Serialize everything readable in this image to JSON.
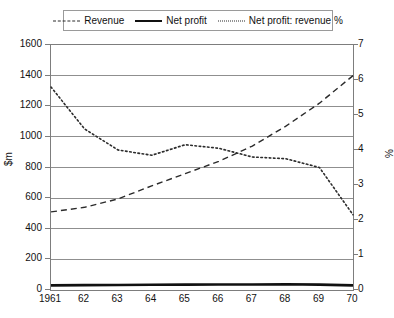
{
  "chart_data": {
    "type": "line",
    "title": "",
    "xlabel": "",
    "ylabel": "$m",
    "ylabel_secondary": "%",
    "categories": [
      "1961",
      "62",
      "63",
      "64",
      "65",
      "66",
      "67",
      "68",
      "69",
      "70"
    ],
    "ylim": [
      0,
      1600
    ],
    "yticks": [
      0,
      200,
      400,
      600,
      800,
      1000,
      1200,
      1400,
      1600
    ],
    "ylim_secondary": [
      0,
      7
    ],
    "yticks_secondary": [
      0,
      1,
      2,
      3,
      4,
      5,
      6,
      7
    ],
    "grid": true,
    "legend_position": "top",
    "series": [
      {
        "name": "Revenue",
        "axis": "left",
        "style": "dashed",
        "values": [
          510,
          540,
          595,
          680,
          760,
          840,
          940,
          1070,
          1220,
          1400
        ]
      },
      {
        "name": "Net profit",
        "axis": "left",
        "style": "solid",
        "values": [
          30,
          32,
          33,
          34,
          35,
          36,
          36,
          38,
          35,
          30
        ]
      },
      {
        "name": "Net profit: revenue %",
        "axis": "right",
        "style": "dotted",
        "values": [
          5.8,
          4.6,
          4.0,
          3.85,
          4.15,
          4.05,
          3.8,
          3.75,
          3.5,
          2.15
        ]
      }
    ]
  },
  "legend": {
    "items": [
      {
        "label": "Revenue",
        "marker": "dashed-line-icon"
      },
      {
        "label": "Net profit",
        "marker": "solid-line-icon"
      },
      {
        "label": "Net profit: revenue %",
        "marker": "dotted-line-icon"
      }
    ]
  },
  "colors": {
    "series_line": "#2b2b2b",
    "net_profit_line": "#111111",
    "grid": "#8f8f8f",
    "frame": "#7d7d7d",
    "background": "#ffffff",
    "text": "#111111"
  }
}
